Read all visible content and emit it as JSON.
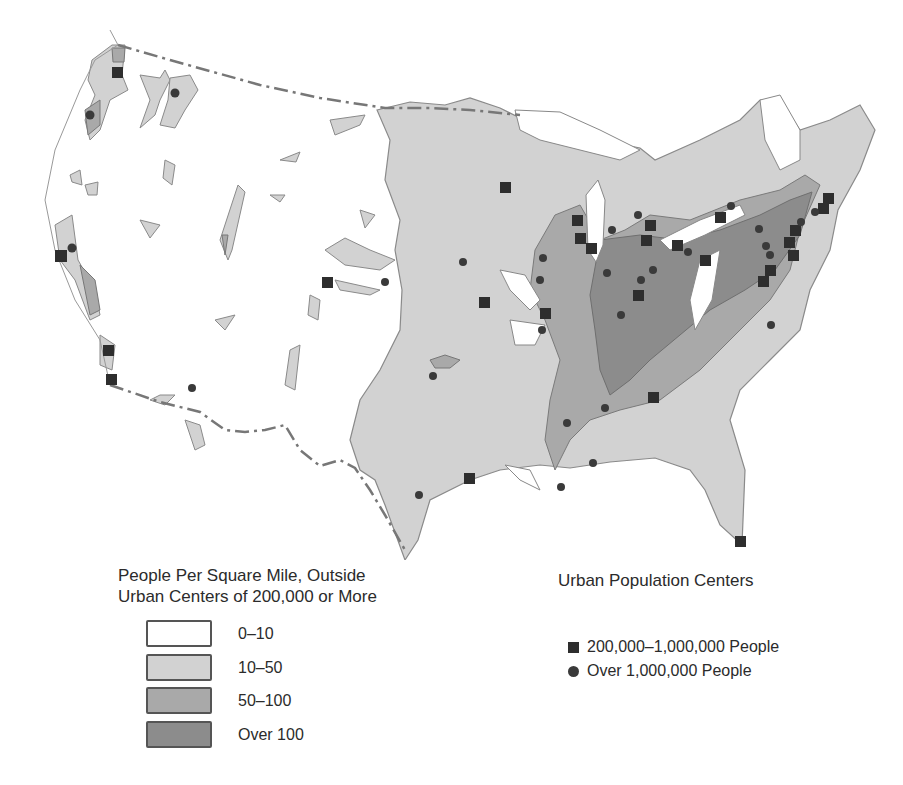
{
  "density_legend": {
    "title_line1": "People Per Square Mile, Outside",
    "title_line2": "Urban Centers of 200,000 or More",
    "classes": [
      {
        "label": "0–10",
        "color": "#ffffff"
      },
      {
        "label": "10–50",
        "color": "#d2d2d2"
      },
      {
        "label": "50–100",
        "color": "#a9a9a9"
      },
      {
        "label": "Over 100",
        "color": "#8c8c8c"
      }
    ]
  },
  "urban_legend": {
    "title": "Urban Population Centers",
    "items": [
      {
        "label": "200,000–1,000,000 People",
        "symbol": "square"
      },
      {
        "label": "Over 1,000,000 People",
        "symbol": "circle"
      }
    ]
  },
  "colors": {
    "border_line": "#777777",
    "symbol": "#2e2e2e"
  }
}
